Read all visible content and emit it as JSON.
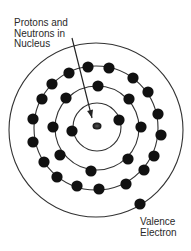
{
  "diagram": {
    "labels": {
      "nucleus_label": [
        "Protons and",
        "Neutrons in",
        "Nucleus"
      ],
      "valence_label": [
        "Valence",
        "Electron"
      ]
    },
    "colors": {
      "line": "#333333",
      "electron": "#111111",
      "nucleus": "#222222"
    },
    "nucleus": {
      "cx": 97,
      "cy": 126,
      "r": 4
    },
    "outer_boundary": {
      "cx": 96,
      "cy": 130,
      "r": 87
    },
    "shells": [
      {
        "name": "shell-1",
        "cx": 97,
        "cy": 127,
        "r": 24,
        "electrons": [
          [
            119,
            120
          ],
          [
            72,
            131
          ]
        ]
      },
      {
        "name": "shell-2",
        "cx": 97,
        "cy": 128,
        "r": 42,
        "electrons": [
          [
            98,
            86
          ],
          [
            66,
            98
          ],
          [
            129,
            99
          ],
          [
            53,
            127
          ],
          [
            141,
            127
          ],
          [
            60,
            155
          ],
          [
            128,
            159
          ],
          [
            91,
            171
          ]
        ]
      },
      {
        "name": "shell-3",
        "cx": 96,
        "cy": 128,
        "r": 62,
        "electrons": [
          [
            88,
            67
          ],
          [
            109,
            68
          ],
          [
            69,
            73
          ],
          [
            133,
            78
          ],
          [
            52,
            84
          ],
          [
            148,
            92
          ],
          [
            42,
            99
          ],
          [
            158,
            114
          ],
          [
            33,
            119
          ],
          [
            161,
            135
          ],
          [
            33,
            142
          ],
          [
            154,
            156
          ],
          [
            44,
            162
          ],
          [
            144,
            170
          ],
          [
            57,
            177
          ],
          [
            126,
            184
          ],
          [
            77,
            186
          ],
          [
            99,
            189
          ]
        ]
      }
    ],
    "valence_electron": {
      "cx": 140,
      "cy": 204
    },
    "arrow": {
      "x1": 72,
      "y1": 38,
      "x2": 92,
      "y2": 118
    }
  }
}
